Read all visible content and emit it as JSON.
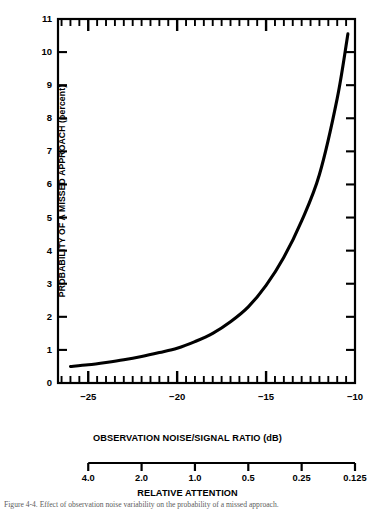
{
  "figure": {
    "caption": "Figure 4-4.  Effect of observation noise variability on the probability of a missed approach."
  },
  "chart_data": {
    "type": "line",
    "title": "",
    "xlabel": "OBSERVATION NOISE/SIGNAL RATIO (dB)",
    "ylabel": "PROBABILITY OF A MISSED APPROACH (percent)",
    "xlim": [
      -26.7,
      -10.0
    ],
    "ylim": [
      0,
      11
    ],
    "grid": false,
    "legend": null,
    "line_color": "#000000",
    "xticks": [
      -25,
      -20,
      -15,
      -10
    ],
    "xtick_labels": [
      "−25",
      "−20",
      "−15",
      "−10"
    ],
    "xminor_step": 0.5,
    "yticks": [
      0,
      1,
      2,
      3,
      4,
      5,
      6,
      7,
      8,
      9,
      10,
      11
    ],
    "ytick_labels": [
      "0",
      "1",
      "2",
      "3",
      "4",
      "5",
      "6",
      "7",
      "8",
      "9",
      "10",
      "11"
    ],
    "x": [
      -26.0,
      -25.0,
      -24.0,
      -23.0,
      -22.0,
      -21.0,
      -20.0,
      -19.0,
      -18.0,
      -17.0,
      -16.0,
      -15.0,
      -14.0,
      -13.0,
      -12.0,
      -11.0,
      -10.4
    ],
    "values": [
      0.5,
      0.55,
      0.62,
      0.7,
      0.8,
      0.92,
      1.05,
      1.25,
      1.5,
      1.85,
      2.3,
      2.95,
      3.8,
      4.9,
      6.3,
      8.6,
      10.55
    ],
    "series": [
      {
        "name": "Probability of a missed approach",
        "values": [
          0.5,
          0.55,
          0.62,
          0.7,
          0.8,
          0.92,
          1.05,
          1.25,
          1.5,
          1.85,
          2.3,
          2.95,
          3.8,
          4.9,
          6.3,
          8.6,
          10.55
        ]
      }
    ],
    "secondary_axis": {
      "label": "RELATIVE ATTENTION",
      "tick_labels": [
        "4.0",
        "2.0",
        "1.0",
        "0.5",
        "0.25",
        "0.125"
      ],
      "tick_values": [
        4.0,
        2.0,
        1.0,
        0.5,
        0.25,
        0.125
      ],
      "tick_positions_db": [
        -25.0,
        -22.0,
        -19.0,
        -16.0,
        -13.0,
        -10.0
      ]
    }
  }
}
